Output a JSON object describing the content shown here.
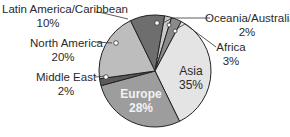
{
  "chart_data": {
    "type": "pie",
    "title": "",
    "start_angle_deg": -26,
    "direction": "clockwise",
    "slices": [
      {
        "label": "Latin America/Caribbean",
        "value": 10,
        "display": "10%",
        "color": "#6e6e6e"
      },
      {
        "label": "Oceania/Australia",
        "value": 2,
        "display": "2%",
        "color": "#c8c8c8"
      },
      {
        "label": "Africa",
        "value": 3,
        "display": "3%",
        "color": "#8a8a8a"
      },
      {
        "label": "Asia",
        "value": 35,
        "display": "35%",
        "color": "#e4e4e4"
      },
      {
        "label": "Europe",
        "value": 28,
        "display": "28%",
        "color": "#9d9d9d"
      },
      {
        "label": "Middle East",
        "value": 2,
        "display": "2%",
        "color": "#5a5a5a"
      },
      {
        "label": "North America",
        "value": 20,
        "display": "20%",
        "color": "#bdbdbd"
      }
    ],
    "legend": "none (callout labels)"
  },
  "labels": {
    "latin_america": {
      "name": "Latin America/Caribbean",
      "pct": "10%"
    },
    "north_america": {
      "name": "North America",
      "pct": "20%"
    },
    "middle_east": {
      "name": "Middle East",
      "pct": "2%"
    },
    "oceania": {
      "name": "Oceania/Australia",
      "pct": "2%"
    },
    "africa": {
      "name": "Africa",
      "pct": "3%"
    },
    "asia": {
      "name": "Asia",
      "pct": "35%"
    },
    "europe": {
      "name": "Europe",
      "pct": "28%"
    }
  }
}
